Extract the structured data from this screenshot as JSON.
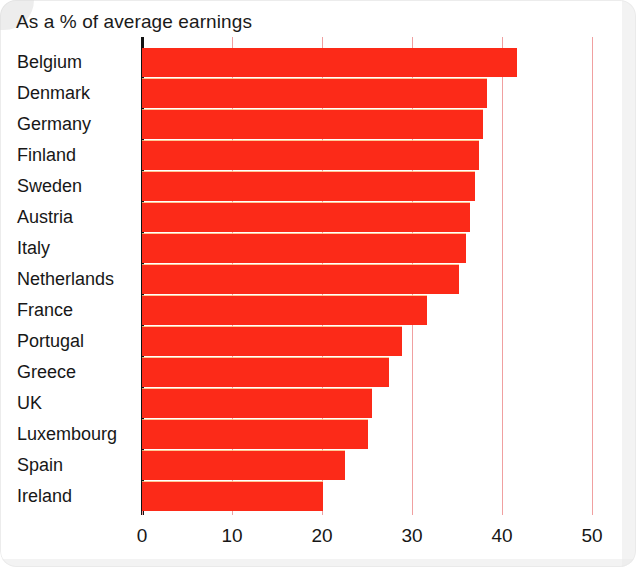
{
  "title": "As a % of average earnings",
  "axis": {
    "x_ticks": [
      "0",
      "10",
      "20",
      "30",
      "40",
      "50"
    ],
    "x_min": 0,
    "x_max": 50
  },
  "colors": {
    "bar": "#fc2a18",
    "gridline": "#f0a0a0",
    "axis": "#121212",
    "text": "#171717",
    "background": "#ffffff"
  },
  "chart_data": {
    "type": "bar",
    "orientation": "horizontal",
    "title": "As a % of average earnings",
    "xlabel": "",
    "ylabel": "",
    "xlim": [
      0,
      50
    ],
    "grid": true,
    "legend": null,
    "categories": [
      "Belgium",
      "Denmark",
      "Germany",
      "Finland",
      "Sweden",
      "Austria",
      "Italy",
      "Netherlands",
      "France",
      "Portugal",
      "Greece",
      "UK",
      "Luxembourg",
      "Spain",
      "Ireland"
    ],
    "values": [
      41.7,
      38.3,
      37.9,
      37.4,
      37.0,
      36.4,
      36.0,
      35.2,
      31.7,
      28.9,
      27.4,
      25.6,
      25.1,
      22.6,
      20.1
    ],
    "tick_values": [
      0,
      10,
      20,
      30,
      40,
      50
    ],
    "tick_labels": [
      "0",
      "10",
      "20",
      "30",
      "40",
      "50"
    ]
  }
}
